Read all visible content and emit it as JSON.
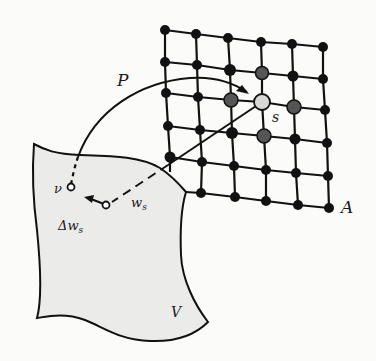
{
  "diagram": {
    "labels": {
      "P": "P",
      "s": "s",
      "A": "A",
      "v": "ν",
      "ws": "w",
      "ws_sub": "s",
      "delta_ws": "Δw",
      "delta_ws_sub": "s",
      "V": "V"
    },
    "colors": {
      "background": "#fbfbfa",
      "surface_fill": "#ebebea",
      "line": "#111111",
      "node": "#111111",
      "node_neighbor": "#555555",
      "node_winner": "#d8d8d6"
    },
    "grid": {
      "rows": 6,
      "cols": 6,
      "winner": {
        "row": 2,
        "col": 3
      },
      "neighbors": [
        [
          1,
          3
        ],
        [
          2,
          2
        ],
        [
          2,
          4
        ],
        [
          3,
          3
        ],
        [
          3,
          2
        ],
        [
          1,
          2
        ],
        [
          3,
          4
        ],
        [
          2,
          1
        ]
      ]
    }
  }
}
